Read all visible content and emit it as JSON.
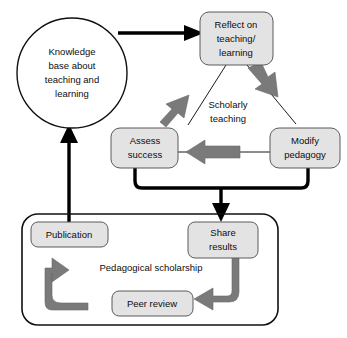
{
  "diagram": {
    "colors": {
      "box_fill": "#e3e3e3",
      "box_stroke": "#5a5a5a",
      "gray_arrow": "#7a7a7a",
      "black_arrow": "#000000",
      "background": "#ffffff",
      "text": "#0d0d0d"
    },
    "nodes": {
      "knowledge_base": {
        "shape": "circle",
        "lines": [
          "Knowledge",
          "base about",
          "teaching and",
          "learning"
        ]
      },
      "reflect": {
        "shape": "rounded-box",
        "lines": [
          "Reflect on",
          "teaching/",
          "learning"
        ]
      },
      "assess": {
        "shape": "rounded-box",
        "lines": [
          "Assess",
          "success"
        ]
      },
      "modify": {
        "shape": "rounded-box",
        "lines": [
          "Modify",
          "pedagogy"
        ]
      },
      "publication": {
        "shape": "rounded-box",
        "lines": [
          "Publication"
        ]
      },
      "share_results": {
        "shape": "rounded-box",
        "lines": [
          "Share",
          "results"
        ]
      },
      "peer_review": {
        "shape": "rounded-box",
        "lines": [
          "Peer review"
        ]
      }
    },
    "group_labels": {
      "scholarly_teaching": [
        "Scholarly",
        "teaching"
      ],
      "pedagogical_scholarship": "Pedagogical scholarship"
    },
    "edges": [
      {
        "name": "knowledge-base-to-reflect",
        "style": "thick-black-arrow"
      },
      {
        "name": "reflect-to-modify",
        "style": "gray-block-arrow"
      },
      {
        "name": "modify-to-assess",
        "style": "gray-block-arrow"
      },
      {
        "name": "assess-to-reflect",
        "style": "gray-block-arrow"
      },
      {
        "name": "assess-and-modify-to-share-results",
        "style": "thick-black-bracket-arrow"
      },
      {
        "name": "share-results-to-peer-review",
        "style": "gray-elbow-arrow"
      },
      {
        "name": "peer-review-to-publication",
        "style": "gray-elbow-arrow"
      },
      {
        "name": "publication-to-knowledge-base",
        "style": "thick-black-arrow"
      }
    ]
  }
}
